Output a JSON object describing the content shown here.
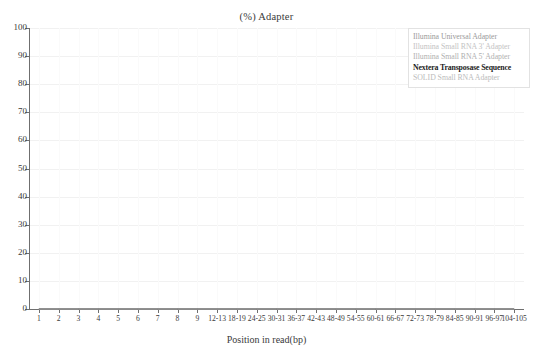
{
  "chart_data": {
    "type": "line",
    "title": "(%) Adapter",
    "xlabel": "Position in read(bp)",
    "ylabel": "",
    "ylim": [
      0,
      100
    ],
    "ytick_values": [
      0,
      10,
      20,
      30,
      40,
      50,
      60,
      70,
      80,
      90,
      100
    ],
    "grid": true,
    "legend_position": "top-right",
    "categories": [
      "1",
      "2",
      "3",
      "4",
      "5",
      "6",
      "7",
      "8",
      "9",
      "12-13",
      "18-19",
      "24-25",
      "30-31",
      "36-37",
      "42-43",
      "48-49",
      "54-55",
      "60-61",
      "66-67",
      "72-73",
      "78-79",
      "84-85",
      "90-91",
      "96-97",
      "104-105"
    ],
    "series": [
      {
        "name": "Illumina Universal Adapter",
        "color": "#9a9a9a",
        "values": [
          0,
          0,
          0,
          0,
          0,
          0,
          0,
          0,
          0,
          0,
          0,
          0,
          0,
          0,
          0,
          0,
          0,
          0,
          0,
          0,
          0,
          0,
          0,
          0,
          0
        ]
      },
      {
        "name": "Illumina Small RNA 3' Adapter",
        "color": "#c3c3c3",
        "values": [
          0,
          0,
          0,
          0,
          0,
          0,
          0,
          0,
          0,
          0,
          0,
          0,
          0,
          0,
          0,
          0,
          0,
          0,
          0,
          0,
          0,
          0,
          0,
          0,
          0
        ]
      },
      {
        "name": "Illumina Small RNA 5' Adapter",
        "color": "#b0b0b0",
        "values": [
          0,
          0,
          0,
          0,
          0,
          0,
          0,
          0,
          0,
          0,
          0,
          0,
          0,
          0,
          0,
          0,
          0,
          0,
          0,
          0,
          0,
          0,
          0,
          0,
          0
        ]
      },
      {
        "name": "Nextera Transposase Sequence",
        "color": "#1c1c1c",
        "values": [
          0,
          0,
          0,
          0,
          0,
          0,
          0,
          0,
          0,
          0,
          0,
          0,
          0,
          0,
          0,
          0,
          0,
          0,
          0,
          0,
          0,
          0,
          0,
          0,
          0
        ]
      },
      {
        "name": "SOLID Small RNA Adapter",
        "color": "#bcbcbc",
        "values": [
          0,
          0,
          0,
          0,
          0,
          0,
          0,
          0,
          0,
          0,
          0,
          0,
          0,
          0,
          0,
          0,
          0,
          0,
          0,
          0,
          0,
          0,
          0,
          0,
          0
        ]
      }
    ]
  },
  "legend": {
    "items": [
      "Illumina Universal Adapter",
      "Illumina Small RNA 3' Adapter",
      "Illumina Small RNA 5' Adapter",
      "Nextera Transposase Sequence",
      "SOLID Small RNA Adapter"
    ]
  },
  "colors": {
    "axis": "#6f6f6f",
    "grid": "#f1f1f1",
    "text": "#3a3a3a",
    "background": "#ffffff"
  }
}
